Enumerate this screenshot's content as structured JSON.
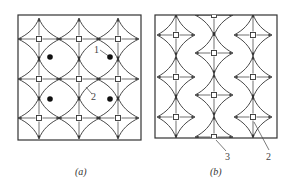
{
  "figure": {
    "panels": [
      {
        "id": "a",
        "caption": "(a)",
        "labels": [
          {
            "text": "1",
            "note": "arc boundary pointer"
          },
          {
            "text": "2",
            "note": "boundary pointer"
          }
        ],
        "grid": {
          "rows": 3,
          "cols": 3
        },
        "filled_dots": 4
      },
      {
        "id": "b",
        "caption": "(b)",
        "labels": [
          {
            "text": "3",
            "note": "edge square pointer"
          },
          {
            "text": "2",
            "note": "square pointer"
          }
        ],
        "columns": 3
      }
    ],
    "colors": {
      "line": "#333333",
      "dot": "#111111",
      "background": "#ffffff"
    }
  }
}
